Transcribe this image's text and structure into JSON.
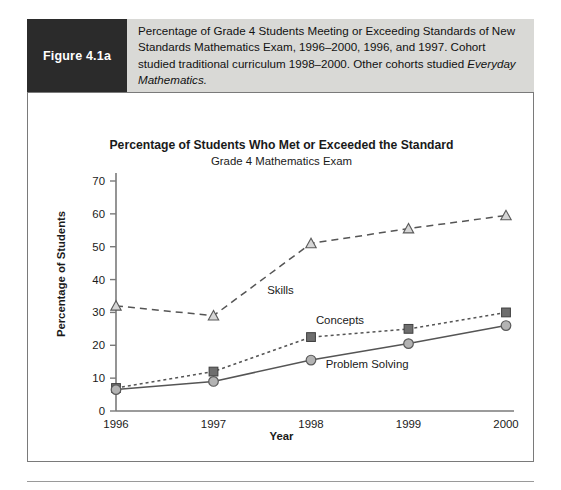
{
  "figure": {
    "tag": "Figure 4.1a",
    "caption_line1": "Percentage of Grade 4 Students Meeting or Exceeding Standards of",
    "caption_line2": "New Standards Mathematics Exam, 1996–2000, 1996, and 1997. Cohort",
    "caption_line3": "studied traditional curriculum 1998–2000. Other cohorts studied",
    "caption_line4_italic": "Everyday Mathematics."
  },
  "colors": {
    "caption_band": "#d9d9d6",
    "figure_tag_bg": "#2b2b2b",
    "axis": "#7a7a7a",
    "skills_marker_fill": "#d6d6d6",
    "concepts_marker_fill": "#6e6e6e",
    "problem_marker_fill": "#b3b3b3",
    "line": "#555555"
  },
  "chart_data": {
    "type": "line",
    "title": "Percentage of Students Who Met or Exceeded the Standard",
    "subtitle": "Grade 4 Mathematics Exam",
    "xlabel": "Year",
    "ylabel": "Percentage of Students",
    "categories": [
      "1996",
      "1997",
      "1998",
      "1999",
      "2000"
    ],
    "x": [
      1996,
      1997,
      1998,
      1999,
      2000
    ],
    "ylim": [
      0,
      70
    ],
    "yticks": [
      0,
      10,
      20,
      30,
      40,
      50,
      60,
      70
    ],
    "grid": false,
    "legend_position": "inline-annotations",
    "series": [
      {
        "name": "Skills",
        "values": [
          32,
          29,
          51,
          55.5,
          59.5
        ],
        "marker": "triangle",
        "linestyle": "dashed",
        "label_x": 1997.55,
        "label_y": 35.5
      },
      {
        "name": "Concepts",
        "values": [
          7,
          12,
          22.5,
          25,
          30
        ],
        "marker": "square",
        "linestyle": "dotted",
        "label_x": 1998.05,
        "label_y": 26.5
      },
      {
        "name": "Problem Solving",
        "values": [
          6.5,
          9,
          15.5,
          20.5,
          26
        ],
        "marker": "circle",
        "linestyle": "solid",
        "label_x": 1998.15,
        "label_y": 13.0
      }
    ],
    "annotations": [
      "Skills",
      "Concepts",
      "Problem Solving"
    ]
  }
}
